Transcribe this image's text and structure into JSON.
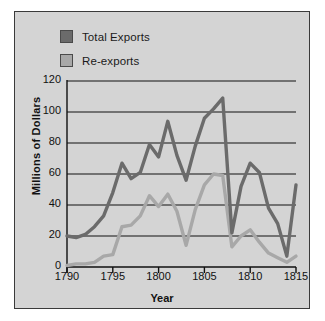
{
  "legend": {
    "position": "top-left",
    "items": [
      {
        "label": "Total Exports",
        "color": "#6b6b6b",
        "name": "total-exports"
      },
      {
        "label": "Re-exports",
        "color": "#a8a8a8",
        "name": "re-exports"
      }
    ]
  },
  "chart_data": {
    "type": "line",
    "title": "",
    "xlabel": "Year",
    "ylabel": "Millions of Dollars",
    "xlim": [
      1790,
      1815
    ],
    "ylim": [
      0,
      120
    ],
    "xticks": [
      1790,
      1795,
      1800,
      1805,
      1810,
      1815
    ],
    "yticks": [
      0,
      20,
      40,
      60,
      80,
      100,
      120
    ],
    "grid": true,
    "x": [
      1790,
      1791,
      1792,
      1793,
      1794,
      1795,
      1796,
      1797,
      1798,
      1799,
      1800,
      1801,
      1802,
      1803,
      1804,
      1805,
      1806,
      1807,
      1808,
      1809,
      1810,
      1811,
      1812,
      1813,
      1814,
      1815
    ],
    "series": [
      {
        "name": "Total Exports",
        "color": "#6b6b6b",
        "values": [
          20,
          19,
          21,
          26,
          33,
          48,
          67,
          57,
          61,
          79,
          71,
          94,
          72,
          56,
          78,
          96,
          102,
          109,
          22,
          52,
          67,
          61,
          38,
          28,
          7,
          53
        ]
      },
      {
        "name": "Re-exports",
        "color": "#a8a8a8",
        "values": [
          1,
          2,
          2,
          3,
          7,
          8,
          26,
          27,
          33,
          46,
          39,
          47,
          36,
          14,
          37,
          53,
          60,
          59,
          13,
          20,
          24,
          16,
          9,
          6,
          3,
          7
        ]
      }
    ]
  }
}
